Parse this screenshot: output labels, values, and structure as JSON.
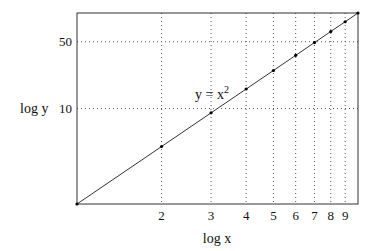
{
  "chart_data": {
    "type": "line",
    "title": "",
    "xlabel": "log x",
    "ylabel": "log y",
    "xscale": "log",
    "yscale": "log",
    "xlim": [
      1,
      10
    ],
    "ylim": [
      1,
      100
    ],
    "grid": "dotted",
    "x_gridlines": [
      2,
      3,
      4,
      5,
      6,
      7,
      8,
      9
    ],
    "y_gridlines": [
      10,
      50
    ],
    "x_tick_labels": [
      "2",
      "3",
      "4",
      "5",
      "6",
      "7",
      "8",
      "9"
    ],
    "y_tick_labels": [
      "10",
      "50"
    ],
    "series": [
      {
        "name": "y = x^2",
        "x": [
          1,
          2,
          3,
          4,
          5,
          6,
          7,
          8,
          9,
          10
        ],
        "values": [
          1,
          4,
          9,
          16,
          25,
          36,
          49,
          64,
          81,
          100
        ],
        "markers": true
      }
    ],
    "annotations": [
      {
        "text": "y = x",
        "superscript": "2",
        "near_x": 3
      }
    ],
    "legend": "none"
  },
  "labels": {
    "xlabel": "log x",
    "ylabel": "log y",
    "annotation_base": "y = x",
    "annotation_sup": "2"
  }
}
